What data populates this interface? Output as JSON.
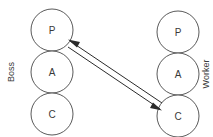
{
  "diagram": {
    "background_color": "#ffffff",
    "stroke_color": "#5a5a5a",
    "arrow_color": "#2b2b2b",
    "text_color": "#3a3a3a",
    "columns": [
      {
        "key": "boss",
        "side_label": "Boss",
        "side_label_orientation": "vertical-rotated-90-ccw",
        "nodes": [
          {
            "key": "boss-p",
            "label": "P",
            "cx": 52,
            "cy": 30,
            "r": 21
          },
          {
            "key": "boss-a",
            "label": "A",
            "cx": 52,
            "cy": 72,
            "r": 21
          },
          {
            "key": "boss-c",
            "label": "C",
            "cx": 52,
            "cy": 114,
            "r": 21
          }
        ]
      },
      {
        "key": "worker",
        "side_label": "Worker",
        "side_label_orientation": "vertical-rotated-90-ccw",
        "nodes": [
          {
            "key": "worker-p",
            "label": "P",
            "cx": 178,
            "cy": 32,
            "r": 21
          },
          {
            "key": "worker-a",
            "label": "A",
            "cx": 178,
            "cy": 74,
            "r": 21
          },
          {
            "key": "worker-c",
            "label": "C",
            "cx": 178,
            "cy": 116,
            "r": 21
          }
        ]
      }
    ],
    "connections": [
      {
        "key": "worker-c-to-boss-p",
        "from": "worker-c",
        "to": "boss-p",
        "direction": "left-up",
        "style": "single-line-with-arrowhead"
      },
      {
        "key": "boss-p-to-worker-c",
        "from": "boss-p",
        "to": "worker-c",
        "direction": "right-down",
        "style": "single-line-with-arrowhead"
      }
    ]
  }
}
